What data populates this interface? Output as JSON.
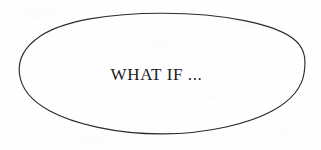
{
  "document": {
    "kind": "hand-drawn-diagram",
    "background_color": "#fefefe",
    "width": 321,
    "height": 150
  },
  "diagram": {
    "shape": {
      "type": "ellipse",
      "name": "what-if-bubble",
      "stroke_color": "#2b2b2b",
      "fill_color": "none",
      "stroke_width": 1.15,
      "center_x": 162,
      "center_y": 73.5,
      "radius_x": 143,
      "radius_y": 60.5
    },
    "label": {
      "text": "WHAT IF ...",
      "color": "#1b1b1b",
      "font_size_px": 17,
      "style": "serif",
      "align": "center"
    }
  }
}
